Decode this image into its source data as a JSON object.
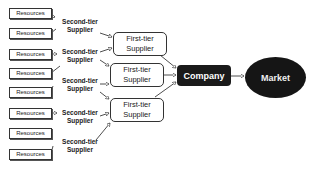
{
  "diagram": {
    "resources": [
      {
        "label": "Resources"
      },
      {
        "label": "Resources"
      },
      {
        "label": "Resources"
      },
      {
        "label": "Resources"
      },
      {
        "label": "Resources"
      },
      {
        "label": "Resources"
      },
      {
        "label": "Resources"
      },
      {
        "label": "Resources"
      }
    ],
    "second_tier": [
      {
        "line1": "Second-tier",
        "line2": "Supplier"
      },
      {
        "line1": "Second-tier",
        "line2": "Supplier"
      },
      {
        "line1": "Second-tier",
        "line2": "Supplier"
      },
      {
        "line1": "Second-tier",
        "line2": "Supplier"
      },
      {
        "line1": "Second-tier",
        "line2": "Supplier"
      }
    ],
    "first_tier": [
      {
        "line1": "First-tier",
        "line2": "Supplier"
      },
      {
        "line1": "First-tier",
        "line2": "Supplier"
      },
      {
        "line1": "First-tier",
        "line2": "Supplier"
      }
    ],
    "company": {
      "label": "Company",
      "color": "#1a1a1a"
    },
    "market": {
      "label": "Market",
      "color": "#151515"
    }
  }
}
